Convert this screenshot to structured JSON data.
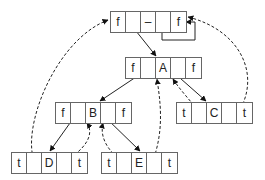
{
  "diagram": {
    "type": "threaded-binary-tree",
    "colors": {
      "line": "#222222",
      "border": "#666666",
      "background": "#ffffff"
    },
    "nodes": [
      {
        "id": "head",
        "cells": [
          "f",
          "",
          "–",
          "",
          "f"
        ],
        "x": 110,
        "y": 11
      },
      {
        "id": "A",
        "cells": [
          "f",
          "",
          "A",
          "",
          "f"
        ],
        "x": 125,
        "y": 57
      },
      {
        "id": "B",
        "cells": [
          "f",
          "",
          "B",
          "",
          "f"
        ],
        "x": 55,
        "y": 102
      },
      {
        "id": "C",
        "cells": [
          "t",
          "",
          "C",
          "",
          "t"
        ],
        "x": 176,
        "y": 102
      },
      {
        "id": "D",
        "cells": [
          "t",
          "",
          "D",
          "",
          "t"
        ],
        "x": 11,
        "y": 152
      },
      {
        "id": "E",
        "cells": [
          "t",
          "",
          "E",
          "",
          "t"
        ],
        "x": 101,
        "y": 152
      }
    ],
    "edges": [
      {
        "from": "head",
        "to": "A",
        "style": "solid"
      },
      {
        "from": "head",
        "to": "head",
        "style": "solid",
        "note": "right self-loop"
      },
      {
        "from": "A",
        "to": "B",
        "style": "solid"
      },
      {
        "from": "A",
        "to": "C",
        "style": "solid"
      },
      {
        "from": "B",
        "to": "D",
        "style": "solid"
      },
      {
        "from": "B",
        "to": "E",
        "style": "solid"
      },
      {
        "from": "D",
        "to": "head",
        "style": "dashed",
        "note": "left thread"
      },
      {
        "from": "D",
        "to": "B",
        "style": "dashed",
        "note": "right thread"
      },
      {
        "from": "E",
        "to": "B",
        "style": "dashed",
        "note": "left thread"
      },
      {
        "from": "E",
        "to": "A",
        "style": "dashed",
        "note": "right thread"
      },
      {
        "from": "C",
        "to": "A",
        "style": "dashed",
        "note": "left thread"
      },
      {
        "from": "C",
        "to": "head",
        "style": "dashed",
        "note": "right thread"
      }
    ]
  }
}
